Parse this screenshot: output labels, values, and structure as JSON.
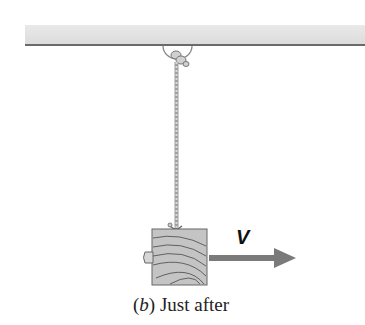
{
  "figure": {
    "velocity_label": "V",
    "caption_part_letter": "b",
    "caption_open": "(",
    "caption_close": ")",
    "caption_text": " Just after"
  },
  "colors": {
    "ceiling": "#e2e2e2",
    "rope": "#a8a8a8",
    "block": "#bdbdbd",
    "arrow": "#7a7a7a"
  }
}
